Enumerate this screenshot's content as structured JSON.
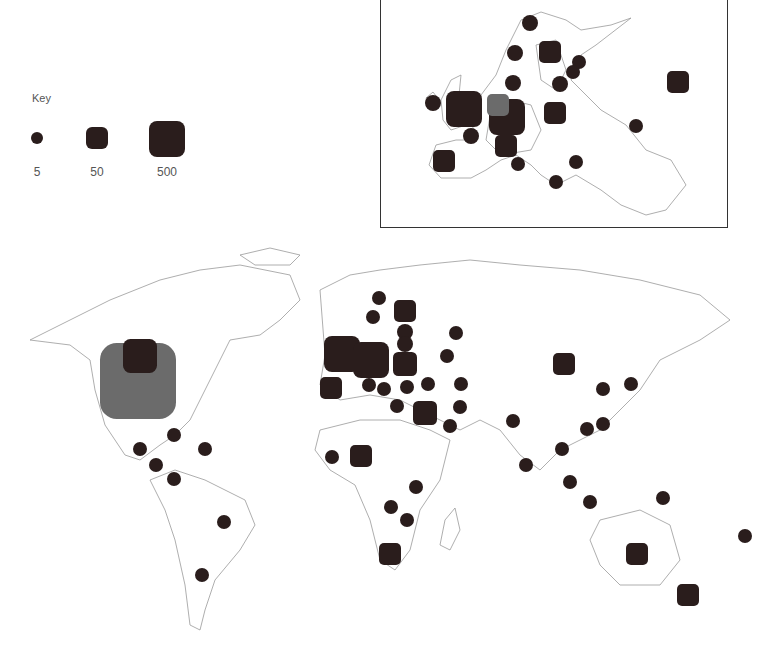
{
  "key": {
    "title": "Key",
    "items": [
      {
        "label": "5",
        "size": 12,
        "shape": "circle"
      },
      {
        "label": "50",
        "size": 22,
        "shape": "rounded-square"
      },
      {
        "label": "500",
        "size": 36,
        "shape": "rounded-square"
      }
    ]
  },
  "colors": {
    "marker": "#2a1d1c",
    "highlight_marker": "#6b6b6b",
    "coastline": "#999999",
    "inset_border": "#333333"
  },
  "inset": {
    "name": "Europe detail",
    "markers": [
      {
        "x": 149,
        "y": 23,
        "size": 16,
        "type": "small"
      },
      {
        "x": 134,
        "y": 53,
        "size": 16,
        "type": "small"
      },
      {
        "x": 169,
        "y": 52,
        "size": 22,
        "type": "medium"
      },
      {
        "x": 198,
        "y": 62,
        "size": 14,
        "type": "small"
      },
      {
        "x": 192,
        "y": 72,
        "size": 14,
        "type": "small"
      },
      {
        "x": 179,
        "y": 84,
        "size": 16,
        "type": "small"
      },
      {
        "x": 132,
        "y": 83,
        "size": 16,
        "type": "small"
      },
      {
        "x": 52,
        "y": 103,
        "size": 16,
        "type": "small"
      },
      {
        "x": 83,
        "y": 109,
        "size": 36,
        "type": "large"
      },
      {
        "x": 126,
        "y": 117,
        "size": 36,
        "type": "large"
      },
      {
        "x": 117,
        "y": 105,
        "size": 22,
        "type": "grey"
      },
      {
        "x": 174,
        "y": 113,
        "size": 22,
        "type": "medium"
      },
      {
        "x": 297,
        "y": 82,
        "size": 22,
        "type": "medium"
      },
      {
        "x": 90,
        "y": 136,
        "size": 16,
        "type": "small"
      },
      {
        "x": 125,
        "y": 146,
        "size": 22,
        "type": "medium"
      },
      {
        "x": 255,
        "y": 126,
        "size": 14,
        "type": "small"
      },
      {
        "x": 63,
        "y": 161,
        "size": 22,
        "type": "medium"
      },
      {
        "x": 137,
        "y": 164,
        "size": 14,
        "type": "small"
      },
      {
        "x": 195,
        "y": 162,
        "size": 14,
        "type": "small"
      },
      {
        "x": 175,
        "y": 182,
        "size": 14,
        "type": "small"
      }
    ]
  },
  "world": {
    "name": "World map",
    "markers": [
      {
        "x": 138,
        "y": 141,
        "size": 76,
        "type": "grey"
      },
      {
        "x": 140,
        "y": 116,
        "size": 34,
        "type": "large"
      },
      {
        "x": 174,
        "y": 195,
        "size": 14,
        "type": "small"
      },
      {
        "x": 140,
        "y": 209,
        "size": 14,
        "type": "small"
      },
      {
        "x": 205,
        "y": 209,
        "size": 14,
        "type": "small"
      },
      {
        "x": 156,
        "y": 225,
        "size": 14,
        "type": "small"
      },
      {
        "x": 174,
        "y": 239,
        "size": 14,
        "type": "small"
      },
      {
        "x": 224,
        "y": 282,
        "size": 14,
        "type": "small"
      },
      {
        "x": 202,
        "y": 335,
        "size": 14,
        "type": "small"
      },
      {
        "x": 379,
        "y": 58,
        "size": 14,
        "type": "small"
      },
      {
        "x": 373,
        "y": 77,
        "size": 14,
        "type": "small"
      },
      {
        "x": 405,
        "y": 71,
        "size": 22,
        "type": "medium"
      },
      {
        "x": 405,
        "y": 92,
        "size": 16,
        "type": "small"
      },
      {
        "x": 405,
        "y": 104,
        "size": 16,
        "type": "small"
      },
      {
        "x": 342,
        "y": 114,
        "size": 36,
        "type": "large"
      },
      {
        "x": 371,
        "y": 120,
        "size": 36,
        "type": "large"
      },
      {
        "x": 405,
        "y": 124,
        "size": 24,
        "type": "medium"
      },
      {
        "x": 331,
        "y": 148,
        "size": 22,
        "type": "medium"
      },
      {
        "x": 369,
        "y": 145,
        "size": 14,
        "type": "small"
      },
      {
        "x": 384,
        "y": 149,
        "size": 14,
        "type": "small"
      },
      {
        "x": 407,
        "y": 147,
        "size": 14,
        "type": "small"
      },
      {
        "x": 428,
        "y": 144,
        "size": 14,
        "type": "small"
      },
      {
        "x": 397,
        "y": 166,
        "size": 14,
        "type": "small"
      },
      {
        "x": 425,
        "y": 173,
        "size": 24,
        "type": "medium"
      },
      {
        "x": 456,
        "y": 93,
        "size": 14,
        "type": "small"
      },
      {
        "x": 447,
        "y": 116,
        "size": 14,
        "type": "small"
      },
      {
        "x": 461,
        "y": 144,
        "size": 14,
        "type": "small"
      },
      {
        "x": 460,
        "y": 167,
        "size": 14,
        "type": "small"
      },
      {
        "x": 450,
        "y": 186,
        "size": 14,
        "type": "small"
      },
      {
        "x": 332,
        "y": 217,
        "size": 14,
        "type": "small"
      },
      {
        "x": 361,
        "y": 216,
        "size": 22,
        "type": "medium"
      },
      {
        "x": 416,
        "y": 247,
        "size": 14,
        "type": "small"
      },
      {
        "x": 391,
        "y": 267,
        "size": 14,
        "type": "small"
      },
      {
        "x": 407,
        "y": 280,
        "size": 14,
        "type": "small"
      },
      {
        "x": 390,
        "y": 314,
        "size": 22,
        "type": "medium"
      },
      {
        "x": 564,
        "y": 124,
        "size": 22,
        "type": "medium"
      },
      {
        "x": 603,
        "y": 149,
        "size": 14,
        "type": "small"
      },
      {
        "x": 631,
        "y": 144,
        "size": 14,
        "type": "small"
      },
      {
        "x": 513,
        "y": 181,
        "size": 14,
        "type": "small"
      },
      {
        "x": 587,
        "y": 189,
        "size": 14,
        "type": "small"
      },
      {
        "x": 603,
        "y": 184,
        "size": 14,
        "type": "small"
      },
      {
        "x": 562,
        "y": 209,
        "size": 14,
        "type": "small"
      },
      {
        "x": 526,
        "y": 225,
        "size": 14,
        "type": "small"
      },
      {
        "x": 570,
        "y": 242,
        "size": 14,
        "type": "small"
      },
      {
        "x": 590,
        "y": 262,
        "size": 14,
        "type": "small"
      },
      {
        "x": 663,
        "y": 258,
        "size": 14,
        "type": "small"
      },
      {
        "x": 637,
        "y": 314,
        "size": 22,
        "type": "medium"
      },
      {
        "x": 745,
        "y": 296,
        "size": 14,
        "type": "small"
      },
      {
        "x": 688,
        "y": 355,
        "size": 22,
        "type": "medium"
      }
    ]
  },
  "caption": {
    "text": ""
  }
}
